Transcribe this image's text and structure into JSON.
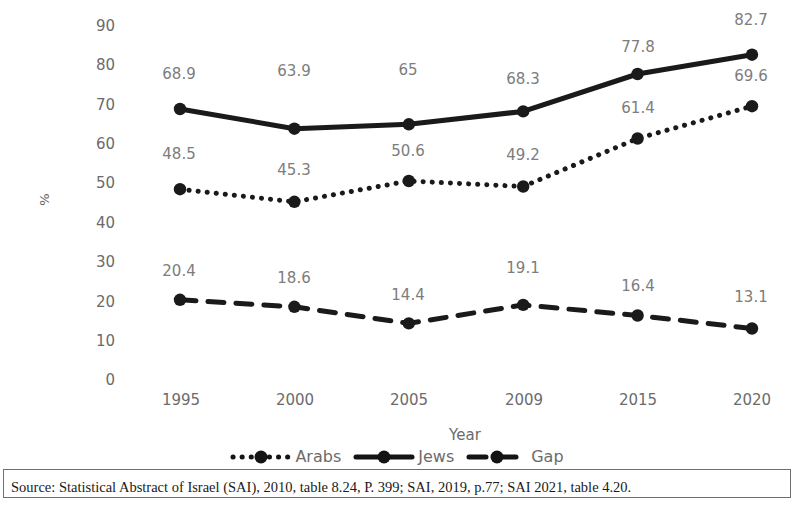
{
  "chart_data": {
    "type": "line",
    "title": "",
    "xlabel": "Year",
    "ylabel": "%",
    "categories": [
      "1995",
      "2000",
      "2005",
      "2009",
      "2015",
      "2020"
    ],
    "ylim": [
      0,
      90
    ],
    "ytick_step": 10,
    "yticks": [
      "90",
      "80",
      "70",
      "60",
      "50",
      "40",
      "30",
      "20",
      "10",
      "0"
    ],
    "grid": false,
    "legend_position": "bottom",
    "series": [
      {
        "name": "Arabs",
        "style": "dotted",
        "color": "#1a1a1a",
        "values": [
          48.5,
          45.3,
          50.6,
          49.2,
          61.4,
          69.6
        ],
        "labels": [
          "48.5",
          "45.3",
          "50.6",
          "49.2",
          "61.4",
          "69.6"
        ]
      },
      {
        "name": "Jews",
        "style": "solid",
        "color": "#1a1a1a",
        "values": [
          68.9,
          63.9,
          65,
          68.3,
          77.8,
          82.7
        ],
        "labels": [
          "68.9",
          "63.9",
          "65",
          "68.3",
          "77.8",
          "82.7"
        ]
      },
      {
        "name": "Gap",
        "style": "dashed",
        "color": "#1a1a1a",
        "values": [
          20.4,
          18.6,
          14.4,
          19.1,
          16.4,
          13.1
        ],
        "labels": [
          "20.4",
          "18.6",
          "14.4",
          "19.1",
          "16.4",
          "13.1"
        ]
      }
    ]
  },
  "legend": {
    "items": [
      {
        "label": "Arabs",
        "style": "dotted"
      },
      {
        "label": "Jews",
        "style": "solid"
      },
      {
        "label": "Gap",
        "style": "dashed"
      }
    ]
  },
  "caption": {
    "source": "Source: Statistical Abstract of Israel (SAI), 2010, table 8.24, P. 399; SAI, 2019, p.77; SAI 2021, table 4.20."
  }
}
